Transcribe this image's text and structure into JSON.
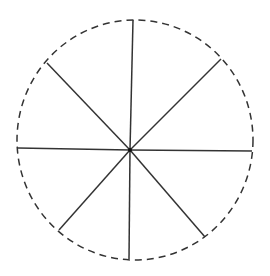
{
  "diagram": {
    "type": "circle-divided-into-8-sectors",
    "stroke_color": "#333333",
    "circle": {
      "cx": 135,
      "cy": 140,
      "rx": 118,
      "ry": 120,
      "style": "dashed"
    },
    "center": {
      "x": 130,
      "y": 150
    },
    "spokes": [
      {
        "x": 133,
        "y": 20
      },
      {
        "x": 221,
        "y": 59
      },
      {
        "x": 252,
        "y": 151
      },
      {
        "x": 205,
        "y": 237
      },
      {
        "x": 129,
        "y": 259
      },
      {
        "x": 59,
        "y": 230
      },
      {
        "x": 18,
        "y": 148
      },
      {
        "x": 47,
        "y": 63
      }
    ],
    "sector_count": 8
  }
}
